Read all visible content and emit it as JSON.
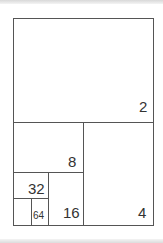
{
  "diagram": {
    "title": "",
    "type": "recursive-subdivision",
    "colors": {
      "line": "#555555",
      "text": "#333333",
      "background": "#ffffff"
    },
    "regions": [
      {
        "label": "2"
      },
      {
        "label": "4"
      },
      {
        "label": "8"
      },
      {
        "label": "16"
      },
      {
        "label": "32"
      },
      {
        "label": "64"
      }
    ]
  }
}
